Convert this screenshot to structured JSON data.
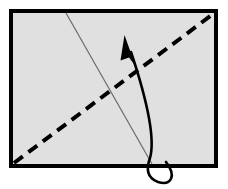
{
  "diagram": {
    "title": "Paper Fold Instruction Diagram",
    "type": "origami-fold-step",
    "canvas": {
      "width": 228,
      "height": 189,
      "background": "#ffffff"
    },
    "colors": {
      "paper_fill": "#e0e0e0",
      "paper_border": "#000000",
      "fold_line": "#000000",
      "crease_line": "#808080",
      "arrow": "#000000"
    },
    "paper": {
      "label": "paper-sheet",
      "shape": "rectangle",
      "x": 11,
      "y": 11,
      "width": 205,
      "height": 155,
      "border_width": 4,
      "fill": "#e0e0e0",
      "stroke": "#000000"
    },
    "fold_line": {
      "label": "valley-fold-line",
      "style": "dashed",
      "stroke_width": 4,
      "dash_pattern": "11 7",
      "from": {
        "x": 14,
        "y": 163
      },
      "to": {
        "x": 213,
        "y": 14
      },
      "description": "Dashed diagonal from bottom-left corner to top-right corner"
    },
    "crease_line": {
      "label": "existing-crease-line",
      "style": "solid-thin",
      "stroke_width": 1,
      "from": {
        "x": 66,
        "y": 13
      },
      "to": {
        "x": 152,
        "y": 164
      },
      "description": "Thin grey crease from top edge down to bottom edge"
    },
    "arrow": {
      "label": "fold-direction-arrow",
      "style": "curved-with-loop",
      "stroke_width": 2.6,
      "path": "M 166 163 C 176 176 170 186 158 182 C 148 179 147 170 150 159 C 154 139 145 98 131 51",
      "tip": {
        "x": 125,
        "y": 36
      },
      "head": {
        "points": "125,36 136,64 130,57 122,60",
        "fill": "#000000"
      },
      "description": "Curved arrow looping below bottom edge and pointing up-left"
    }
  }
}
